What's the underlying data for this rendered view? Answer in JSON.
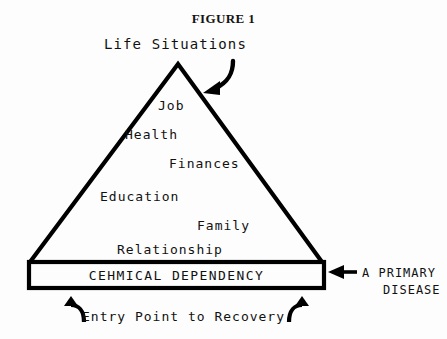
{
  "figure": {
    "title": "FIGURE 1",
    "apex_label": "Life Situations",
    "tiers": [
      {
        "key": "job",
        "label": "Job"
      },
      {
        "key": "health",
        "label": "Health"
      },
      {
        "key": "finances",
        "label": "Finances"
      },
      {
        "key": "education",
        "label": "Education"
      },
      {
        "key": "family",
        "label": "Family"
      },
      {
        "key": "relationship",
        "label": "Relationship"
      }
    ],
    "base_box_label": "CEHMICAL DEPENDENCY",
    "right_annotation": {
      "line1": "A PRIMARY",
      "line2": "DISEASE"
    },
    "bottom_annotation": "Entry Point to Recovery",
    "colors": {
      "ink": "#111111",
      "background": "#fdfdfd",
      "stroke": "#000000"
    },
    "icons": {
      "apex_arrow": "curved-arrow-down-left-icon",
      "right_arrow": "arrow-left-icon",
      "bottom_left_hook": "hook-arrow-up-left-icon",
      "bottom_right_hook": "hook-arrow-up-right-icon"
    }
  }
}
